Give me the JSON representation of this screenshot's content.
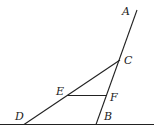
{
  "diagram": {
    "labels": {
      "A": "A",
      "B": "B",
      "C": "C",
      "D": "D",
      "E": "E",
      "F": "F"
    },
    "points": {
      "A": [
        137,
        10
      ],
      "B": [
        96,
        124
      ],
      "C": [
        120,
        60
      ],
      "D": [
        24,
        124
      ],
      "E": [
        67,
        95
      ],
      "F": [
        107,
        96
      ]
    },
    "segments": [
      "AB (through C, F)",
      "CD (through E)",
      "EF",
      "baseline through D and B"
    ],
    "stroke_color": "#222222"
  }
}
